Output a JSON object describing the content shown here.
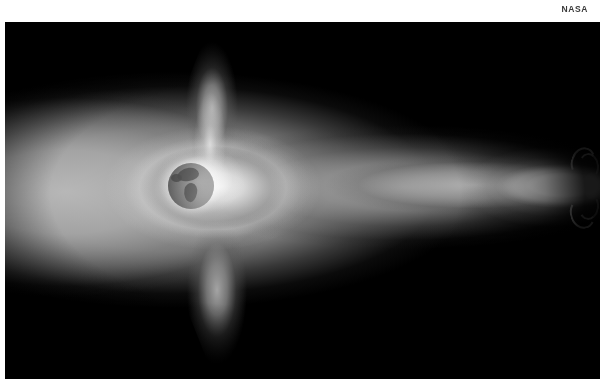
{
  "credit": {
    "label": "NASA"
  },
  "image": {
    "subject": "Earth magnetosphere visualization",
    "background_color": "#000000",
    "page_color": "#ffffff",
    "halo_color": "#9a9a9a",
    "jet_color": "#ffffff",
    "earth_color": "#8d8d8d",
    "features": [
      {
        "name": "earth-disc",
        "label": "Earth"
      },
      {
        "name": "plasmasphere-glow",
        "label": "Plasmasphere"
      },
      {
        "name": "polar-spike-upper",
        "label": "Northern polar plume"
      },
      {
        "name": "polar-spike-lower",
        "label": "Southern polar plume"
      },
      {
        "name": "magnetotail",
        "label": "Magnetotail"
      },
      {
        "name": "plasma-jet",
        "label": "Plasma jet"
      }
    ]
  }
}
